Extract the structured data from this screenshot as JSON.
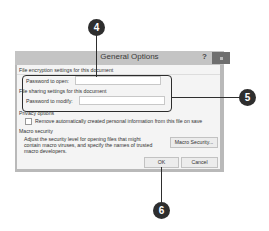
{
  "dialog": {
    "title": "General Options",
    "help_label": "?",
    "encryption_section": "File encryption settings for this document",
    "password_open_label": "Password to open:",
    "password_open_value": "",
    "sharing_section": "File sharing settings for this document",
    "password_modify_label": "Password to modify:",
    "password_modify_value": "",
    "privacy_section": "Privacy options",
    "remove_info_label": "Remove automatically created personal information from this file on save",
    "remove_info_checked": false,
    "macro_section": "Macro security",
    "macro_text_1": "Adjust the security level for opening files that might",
    "macro_text_2": "contain macro viruses, and specify the names of trusted",
    "macro_text_3": "macro developers.",
    "macro_button": "Macro Security...",
    "ok_button": "OK",
    "cancel_button": "Cancel"
  },
  "callouts": {
    "c4": "4",
    "c5": "5",
    "c6": "6"
  }
}
